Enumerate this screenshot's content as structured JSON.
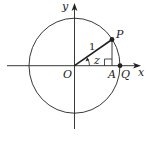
{
  "diagram": {
    "colors": {
      "stroke": "#222222",
      "background": "#ffffff"
    },
    "labels": {
      "y_axis": "y",
      "x_axis": "x",
      "origin": "O",
      "point_p": "P",
      "point_a": "A",
      "point_q": "Q",
      "radius": "1",
      "angle": "z"
    }
  }
}
